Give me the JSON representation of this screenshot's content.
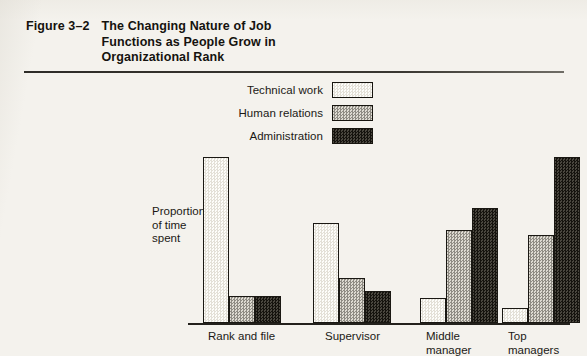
{
  "figure": {
    "number": "Figure 3–2",
    "title_lines": [
      "The Changing Nature of Job",
      "Functions as People Grow in",
      "Organizational Rank"
    ]
  },
  "chart_data": {
    "type": "bar",
    "title": "The Changing Nature of Job Functions as People Grow in Organizational Rank",
    "xlabel": "",
    "ylabel": "Proportion of time spent",
    "ylim": [
      0,
      100
    ],
    "grid": false,
    "legend_position": "top-center",
    "categories": [
      "Rank and file",
      "Supervisor",
      "Middle manager",
      "Top managers"
    ],
    "category_label_lines": [
      [
        "Rank and file"
      ],
      [
        "Supervisor"
      ],
      [
        "Middle",
        "manager"
      ],
      [
        "Top",
        "managers"
      ]
    ],
    "series": [
      {
        "name": "Technical work",
        "swatch": "white-stipple",
        "values": [
          100,
          60,
          15,
          9
        ]
      },
      {
        "name": "Human relations",
        "swatch": "light-gray-stipple",
        "values": [
          16,
          27,
          56,
          53
        ]
      },
      {
        "name": "Administration",
        "swatch": "dark-stipple",
        "values": [
          16,
          19,
          69,
          100
        ]
      }
    ],
    "colors": {
      "technical_work": "#fbfaf6",
      "human_relations": "#c9c6bd",
      "administration": "#34312b",
      "outline": "#1a1813",
      "axis": "#23211c",
      "page_background": "#f4f2ed",
      "text": "#1b1915"
    }
  },
  "axis": {
    "y_label_lines": [
      "Proportion",
      "of time",
      "spent"
    ]
  }
}
